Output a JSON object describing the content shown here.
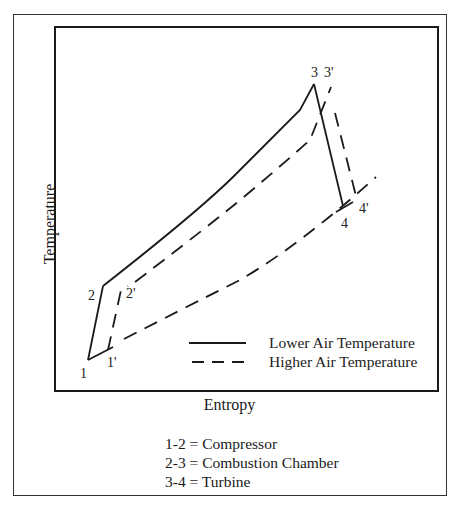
{
  "diagram": {
    "type": "T-s diagram",
    "y_axis_label": "Temperature",
    "x_axis_label": "Entropy",
    "point_labels": {
      "p1": "1",
      "p1p": "1'",
      "p2": "2",
      "p2p": "2'",
      "p3": "3",
      "p3p": "3'",
      "p4": "4",
      "p4p": "4'"
    },
    "legend": [
      {
        "style": "solid",
        "label": "Lower Air Temperature"
      },
      {
        "style": "dashed",
        "label": "Higher Air Temperature"
      }
    ],
    "notes": [
      "1-2 = Compressor",
      "2-3 = Combustion Chamber",
      "3-4 = Turbine"
    ],
    "colors": {
      "line": "#1a1a1a",
      "frame": "#333333",
      "background": "#ffffff"
    }
  }
}
